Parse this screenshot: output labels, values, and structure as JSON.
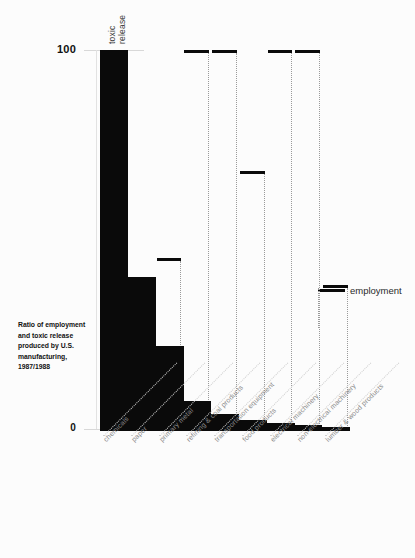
{
  "chart_data": {
    "type": "bar",
    "title": "",
    "caption": "Ratio of employment and toxic release produced by U.S. manufacturing, 1987/1988",
    "xlabel": "",
    "ylabel": "",
    "ylim": [
      0,
      100
    ],
    "yticks": [
      0,
      100
    ],
    "ytick_labels": [
      "0",
      "100"
    ],
    "grid": false,
    "legend_position": "right",
    "categories": [
      "chemicals",
      "paper",
      "primary metal",
      "refining & coal products",
      "transportation equipment",
      "food products",
      "electrical machinery",
      "non-electrical machinery",
      "lumber & wood products"
    ],
    "series": [
      {
        "name": "toxic release",
        "render": "filled-bar",
        "values": [
          100,
          40,
          22,
          7.5,
          4.0,
          2.4,
          1.6,
          1.1,
          0.6
        ]
      },
      {
        "name": "employment",
        "render": "marker-dash",
        "values": [
          null,
          38,
          45,
          100,
          100,
          68,
          100,
          100,
          38
        ]
      }
    ],
    "annotations": [
      {
        "text": "toxic release",
        "orientation": "vertical",
        "target": "chemicals"
      },
      {
        "text": "employment",
        "orientation": "horizontal",
        "target": "legend"
      }
    ]
  },
  "axis": {
    "top_label": "100",
    "bottom_label": "0"
  },
  "legend": {
    "employment_label": "employment"
  },
  "column_annotation": {
    "line1": "toxic",
    "line2": "release"
  },
  "caption": {
    "text": "Ratio of employment and toxic release produced by U.S. manufacturing, 1987/1988"
  },
  "colors": {
    "ink": "#0a0a0a",
    "background": "#fcfcfc",
    "muted": "#8a8a8a",
    "dotted": "#cfcfcf"
  }
}
